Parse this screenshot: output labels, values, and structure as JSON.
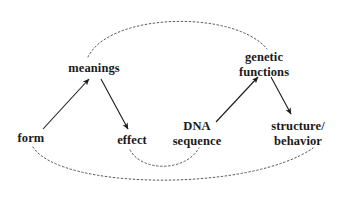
{
  "diagram": {
    "background_color": "#ffffff",
    "stroke_color": "#1a1a1a",
    "dash_color": "#555555",
    "nodes": [
      {
        "id": "form",
        "label_lines": [
          "form"
        ],
        "x": 31,
        "y": 138
      },
      {
        "id": "meanings",
        "label_lines": [
          "meanings"
        ],
        "x": 94,
        "y": 68
      },
      {
        "id": "effect",
        "label_lines": [
          "effect"
        ],
        "x": 132,
        "y": 140
      },
      {
        "id": "dna",
        "label_lines": [
          "DNA",
          "sequence"
        ],
        "x": 197,
        "y": 133
      },
      {
        "id": "genetic",
        "label_lines": [
          "genetic",
          "functions"
        ],
        "x": 264,
        "y": 64
      },
      {
        "id": "structure",
        "label_lines": [
          "structure/",
          "behavior"
        ],
        "x": 298,
        "y": 133
      }
    ],
    "solid_arrows": [
      {
        "id": "form-to-meanings",
        "from": "form",
        "to": "meanings",
        "x1": 43,
        "y1": 129,
        "x2": 89,
        "y2": 79
      },
      {
        "id": "meanings-to-effect",
        "from": "meanings",
        "to": "effect",
        "x1": 101,
        "y1": 79,
        "x2": 128,
        "y2": 129
      },
      {
        "id": "dna-to-genetic",
        "from": "dna",
        "to": "genetic",
        "x1": 216,
        "y1": 122,
        "x2": 258,
        "y2": 77
      },
      {
        "id": "genetic-to-structure",
        "from": "genetic",
        "to": "structure",
        "x1": 271,
        "y1": 77,
        "x2": 291,
        "y2": 114
      }
    ],
    "dashed_curves": [
      {
        "id": "meanings-to-genetic-arc",
        "from": "meanings",
        "to": "genetic",
        "path": "M 88 57 C 110 12, 235 10, 267 49"
      },
      {
        "id": "form-to-structure-arc",
        "from": "form",
        "to": "structure",
        "path": "M 33 147 C 60 190, 250 192, 313 148"
      },
      {
        "id": "effect-to-sequence-arc",
        "from": "effect",
        "to": "dna",
        "path": "M 130 150 C 142 172, 185 172, 199 148"
      }
    ]
  }
}
